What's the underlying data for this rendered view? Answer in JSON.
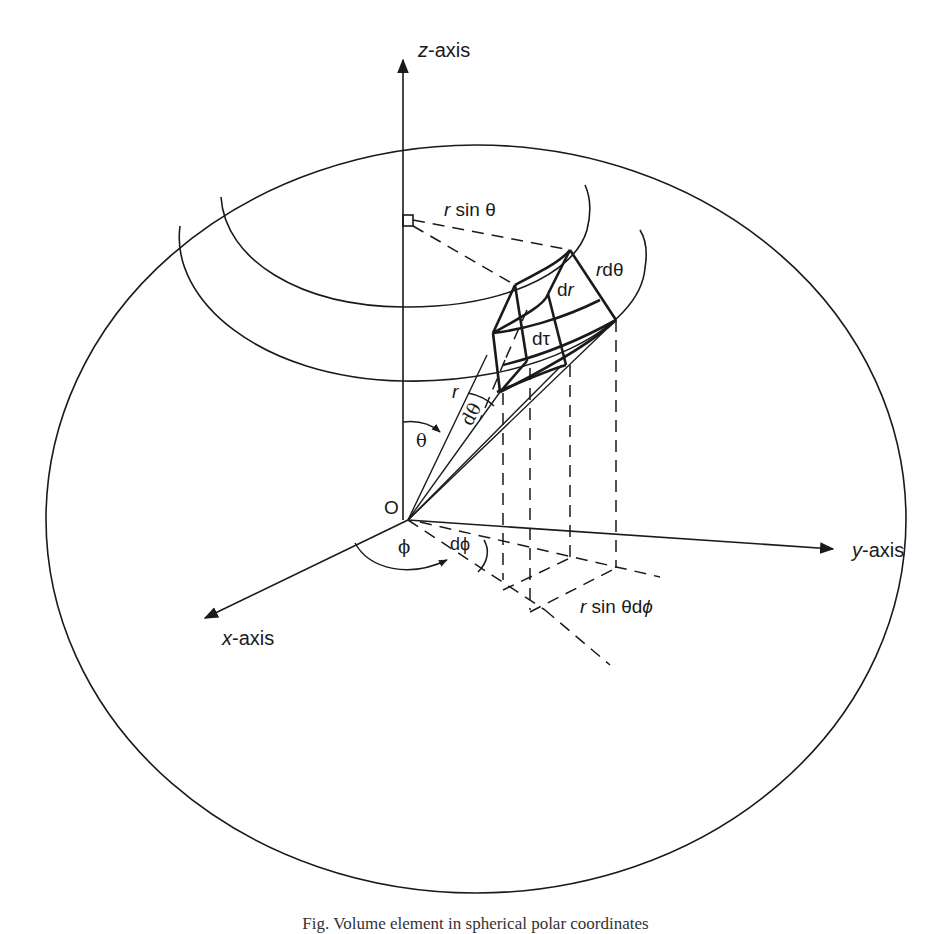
{
  "figure": {
    "type": "diagram",
    "subject": "Volume element in spherical polar coordinates",
    "caption": "Fig. Volume element in spherical polar coordinates",
    "top_cut_text": "",
    "stroke_color": "#1a1a1a",
    "background": "#ffffff"
  },
  "axes": {
    "z": {
      "italic": "z",
      "suffix": "-axis"
    },
    "y": {
      "italic": "y",
      "suffix": "-axis"
    },
    "x": {
      "italic": "x",
      "suffix": "-axis"
    }
  },
  "labels": {
    "origin": "O",
    "r_sin_theta": {
      "italic": "r",
      "rest": " sin θ"
    },
    "r_dtheta": {
      "italic": "r",
      "rest": "dθ"
    },
    "dr": {
      "pre": "d",
      "italic": "r"
    },
    "dtau": "dτ",
    "r": "r",
    "dtheta": "dθ",
    "theta": "θ",
    "phi": "ϕ",
    "dphi": "dϕ",
    "r_sin_theta_dphi": {
      "italic": "r",
      "rest": " sin θd",
      "phi": "ϕ"
    }
  }
}
